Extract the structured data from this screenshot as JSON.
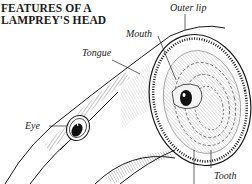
{
  "title": {
    "line1": "FEATURES OF A",
    "line2": "LAMPREY'S HEAD"
  },
  "labels": {
    "outer_lip": "Outer lip",
    "mouth": "Mouth",
    "tongue": "Tongue",
    "eye": "Eye",
    "tooth": "Tooth"
  },
  "colors": {
    "ink": "#1a1a1a",
    "background": "#ffffff"
  }
}
